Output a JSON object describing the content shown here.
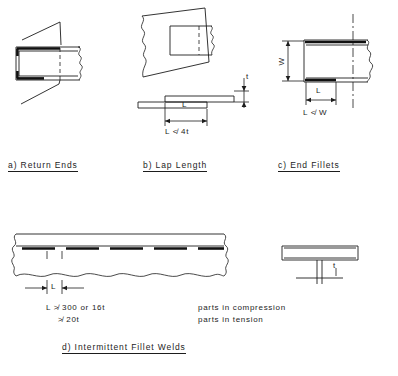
{
  "document": {
    "type": "engineering-drawing",
    "subject": "Fillet weld detailing requirements"
  },
  "figures": [
    {
      "id": "a",
      "caption": "a)  Return  Ends",
      "label_prefix": "a)",
      "label_text": "Return  Ends"
    },
    {
      "id": "b",
      "caption": "b)  Lap  Length",
      "label_prefix": "b)",
      "label_text": "Lap  Length",
      "dimensions": [
        {
          "name": "L",
          "text": "L"
        },
        {
          "name": "t",
          "text": "t"
        }
      ],
      "condition": "L ≮ 4t"
    },
    {
      "id": "c",
      "caption": "c)  End  Fillets",
      "label_prefix": "c)",
      "label_text": "End  Fillets",
      "dimensions": [
        {
          "name": "W",
          "text": "W"
        },
        {
          "name": "L",
          "text": "L"
        }
      ],
      "condition": "L ≮ W"
    },
    {
      "id": "d",
      "caption": "d)  Intermittent  Fillet  Welds",
      "label_prefix": "d)",
      "label_text": "Intermittent  Fillet  Welds",
      "dimensions": [
        {
          "name": "L",
          "text": "L"
        },
        {
          "name": "t",
          "text": "t"
        }
      ],
      "notes": [
        {
          "expression": "L ≯ 300  or  16t",
          "description": "parts  in  compression"
        },
        {
          "expression": "≯ 20t",
          "description": "parts  in  tension"
        }
      ]
    }
  ],
  "colors": {
    "line": "#1d1d1d",
    "weld": "#111111",
    "background": "#ffffff"
  }
}
